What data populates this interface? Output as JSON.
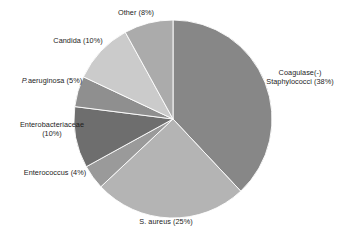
{
  "chart_data": {
    "type": "pie",
    "title": "",
    "subtitle": "",
    "xlabel": "",
    "ylabel": "",
    "legend_position": "none",
    "grid": false,
    "units": "percent",
    "start_angle_deg": 0,
    "direction": "clockwise",
    "categories": [
      "Coagulase(-) Staphylococci",
      "S. aureus",
      "Enterococcus",
      "Enterobacteriaceae",
      "P. aeruginosa",
      "Candida",
      "Other"
    ],
    "values": [
      38,
      25,
      4,
      10,
      5,
      10,
      8
    ],
    "slices": [
      {
        "name": "Coagulase(-) Staphylococci",
        "value": 38,
        "color": "#878787"
      },
      {
        "name": "S. aureus",
        "value": 25,
        "color": "#b4b4b4"
      },
      {
        "name": "Enterococcus",
        "value": 4,
        "color": "#9a9a9a"
      },
      {
        "name": "Enterobacteriaceae",
        "value": 10,
        "color": "#6e6e6e"
      },
      {
        "name": "P. aeruginosa",
        "value": 5,
        "color": "#8f8f8f"
      },
      {
        "name": "Candida",
        "value": 10,
        "color": "#cbcbcb"
      },
      {
        "name": "Other",
        "value": 8,
        "color": "#ababab"
      }
    ]
  },
  "labels": {
    "other": "Other (8%)",
    "candida": "Candida (10%)",
    "paeruginosa_genus": "P.",
    "paeruginosa_rest": "aeruginosa (5%)",
    "enterobacteriaceae_line1": "Enterobacteriaceae",
    "enterobacteriaceae_line2": "(10%)",
    "enterococcus": "Enterococcus (4%)",
    "saureus": "S. aureus (25%)",
    "coagulase_line1": "Coagulase(-)",
    "coagulase_line2": "Staphylococci (38%)"
  }
}
